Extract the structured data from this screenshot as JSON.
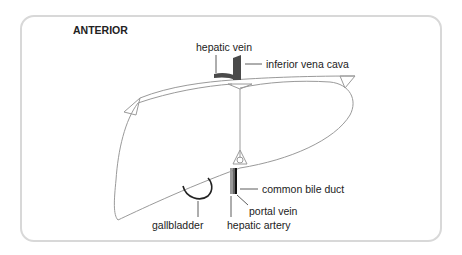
{
  "diagram": {
    "title": "ANTERIOR",
    "labels": {
      "hepatic_vein": "hepatic vein",
      "inferior_vena_cava": "inferior vena cava",
      "common_bile_duct": "common bile duct",
      "portal_vein": "portal vein",
      "hepatic_artery": "hepatic artery",
      "gallbladder": "gallbladder"
    },
    "colors": {
      "outline": "#9a9a9a",
      "frame": "#d8d8d8",
      "vessel_dark": "#4a4a4a",
      "bile_duct": "#111111",
      "portal_vein": "#666666",
      "hepatic_artery": "#9a9a9a",
      "text": "#222222"
    }
  }
}
